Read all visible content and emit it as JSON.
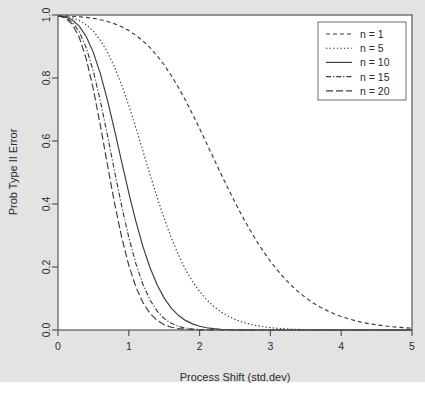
{
  "figure": {
    "background_color": "#e3e3e3",
    "plot_background_color": "#ffffff",
    "axis_color": "#555555",
    "line_color": "#3a3a3a",
    "legend_border_color": "#7a7a7a"
  },
  "chart_data": {
    "type": "line",
    "title": "",
    "xlabel": "Process Shift (std.dev)",
    "ylabel": "Prob Type II Error",
    "xlim": [
      0,
      5
    ],
    "ylim": [
      0,
      1
    ],
    "xticks": [
      0,
      1,
      2,
      3,
      4,
      5
    ],
    "xtick_labels": [
      "0",
      "1",
      "2",
      "3",
      "4",
      "5"
    ],
    "yticks": [
      0.0,
      0.2,
      0.4,
      0.6,
      0.8,
      1.0
    ],
    "ytick_labels": [
      "0.0",
      "0.2",
      "0.4",
      "0.6",
      "0.8",
      "1.0"
    ],
    "grid": false,
    "legend_position": "top-right",
    "x": [
      0,
      0.1,
      0.2,
      0.3,
      0.4,
      0.5,
      0.6,
      0.7,
      0.8,
      0.9,
      1.0,
      1.1,
      1.2,
      1.3,
      1.4,
      1.5,
      1.6,
      1.7,
      1.8,
      1.9,
      2.0,
      2.1,
      2.2,
      2.3,
      2.4,
      2.5,
      2.6,
      2.7,
      2.8,
      2.9,
      3.0,
      3.1,
      3.2,
      3.3,
      3.4,
      3.5,
      3.6,
      3.7,
      3.8,
      3.9,
      4.0,
      4.1,
      4.2,
      4.3,
      4.4,
      4.5,
      4.6,
      4.7,
      4.8,
      4.9,
      5.0
    ],
    "series": [
      {
        "name": "n = 1",
        "n": 1,
        "dash": "4,3",
        "values": [
          0.9973,
          0.997,
          0.9961,
          0.9946,
          0.9924,
          0.9893,
          0.985,
          0.9793,
          0.9719,
          0.9625,
          0.9505,
          0.9357,
          0.9177,
          0.8962,
          0.8708,
          0.8413,
          0.8078,
          0.7704,
          0.7294,
          0.6856,
          0.6395,
          0.5921,
          0.5442,
          0.4967,
          0.45,
          0.4052,
          0.3623,
          0.322,
          0.2844,
          0.2498,
          0.2181,
          0.1894,
          0.1637,
          0.1407,
          0.1203,
          0.1024,
          0.0867,
          0.0732,
          0.0615,
          0.0515,
          0.0429,
          0.0356,
          0.0294,
          0.0242,
          0.0199,
          0.0162,
          0.0132,
          0.0107,
          0.0087,
          0.007,
          0.0056
        ]
      },
      {
        "name": "n = 5",
        "n": 5,
        "dash": "1.4,2.2",
        "values": [
          0.9973,
          0.9959,
          0.9914,
          0.9829,
          0.969,
          0.9484,
          0.9196,
          0.8817,
          0.8342,
          0.7775,
          0.7128,
          0.6422,
          0.5681,
          0.4936,
          0.4214,
          0.3538,
          0.2926,
          0.2388,
          0.1927,
          0.1539,
          0.1221,
          0.0959,
          0.0748,
          0.0578,
          0.0443,
          0.0337,
          0.0254,
          0.019,
          0.0141,
          0.0104,
          0.0076,
          0.0055,
          0.0039,
          0.0028,
          0.0019,
          0.0013,
          0.0009,
          0.0006,
          0.0004,
          0.0003,
          0.0002,
          0.0001,
          0.0001,
          0.0001,
          0.0,
          0.0,
          0.0,
          0.0,
          0.0,
          0.0,
          0.0
        ]
      },
      {
        "name": "n = 10",
        "n": 10,
        "dash": "",
        "values": [
          0.9973,
          0.9944,
          0.9847,
          0.9648,
          0.931,
          0.8806,
          0.8125,
          0.7285,
          0.6332,
          0.5333,
          0.4353,
          0.3446,
          0.2648,
          0.1977,
          0.1435,
          0.1013,
          0.0697,
          0.0467,
          0.0305,
          0.0195,
          0.0121,
          0.0073,
          0.0043,
          0.0025,
          0.0014,
          0.0008,
          0.0004,
          0.0002,
          0.0001,
          0.0001,
          0.0,
          0.0,
          0.0,
          0.0,
          0.0,
          0.0,
          0.0,
          0.0,
          0.0,
          0.0,
          0.0,
          0.0,
          0.0,
          0.0,
          0.0,
          0.0,
          0.0,
          0.0,
          0.0,
          0.0,
          0.0
        ]
      },
      {
        "name": "n = 15",
        "n": 15,
        "dash": "5,2,1.2,2",
        "values": [
          0.9973,
          0.993,
          0.9781,
          0.9471,
          0.8952,
          0.8207,
          0.7257,
          0.6167,
          0.5026,
          0.3925,
          0.2937,
          0.2106,
          0.1446,
          0.0952,
          0.0601,
          0.0364,
          0.0211,
          0.0117,
          0.0063,
          0.0032,
          0.0016,
          0.0008,
          0.0004,
          0.0002,
          0.0001,
          0.0,
          0.0,
          0.0,
          0.0,
          0.0,
          0.0,
          0.0,
          0.0,
          0.0,
          0.0,
          0.0,
          0.0,
          0.0,
          0.0,
          0.0,
          0.0,
          0.0,
          0.0,
          0.0,
          0.0,
          0.0,
          0.0,
          0.0,
          0.0,
          0.0,
          0.0
        ]
      },
      {
        "name": "n = 20",
        "n": 20,
        "dash": "7,3",
        "values": [
          0.9973,
          0.9915,
          0.9713,
          0.9293,
          0.8599,
          0.7635,
          0.6472,
          0.5222,
          0.4013,
          0.2938,
          0.2053,
          0.1368,
          0.0869,
          0.0527,
          0.0305,
          0.0169,
          0.0089,
          0.0045,
          0.0022,
          0.001,
          0.0004,
          0.0002,
          0.0001,
          0.0,
          0.0,
          0.0,
          0.0,
          0.0,
          0.0,
          0.0,
          0.0,
          0.0,
          0.0,
          0.0,
          0.0,
          0.0,
          0.0,
          0.0,
          0.0,
          0.0,
          0.0,
          0.0,
          0.0,
          0.0,
          0.0,
          0.0,
          0.0,
          0.0,
          0.0,
          0.0,
          0.0
        ]
      }
    ]
  }
}
